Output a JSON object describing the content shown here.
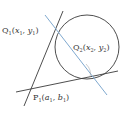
{
  "diagram": {
    "colors": {
      "stroke": "#3a3a3a",
      "chord": "#7fa9cf",
      "background": "#ffffff"
    },
    "circle": {
      "cx": 87,
      "cy": 47,
      "r": 32
    },
    "lines": {
      "tangent1": {
        "x1": 63,
        "y1": 11,
        "x2": 24,
        "y2": 106
      },
      "tangent2": {
        "x1": 16,
        "y1": 92,
        "x2": 118,
        "y2": 71
      },
      "chord": {
        "x1": 45,
        "y1": 15,
        "x2": 107,
        "y2": 95
      }
    },
    "labels": {
      "q1": {
        "main": "Q",
        "sub": "1",
        "coords_open": "(",
        "x": "x",
        "x_sub": "1",
        "sep": ", ",
        "y": "y",
        "y_sub": "1",
        "coords_close": ")"
      },
      "q2": {
        "main": "Q",
        "sub": "2",
        "coords_open": "(",
        "x": "x",
        "x_sub": "2",
        "sep": ", ",
        "y": "y",
        "y_sub": "2",
        "coords_close": ")"
      },
      "p1": {
        "main": "P",
        "sub": "1",
        "coords_open": "(",
        "x": "a",
        "x_sub": "1",
        "sep": ", ",
        "y": "b",
        "y_sub": "1",
        "coords_close": ")"
      }
    }
  }
}
